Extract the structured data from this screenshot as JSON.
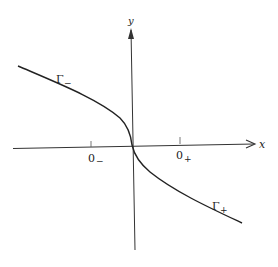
{
  "diagram": {
    "axes": {
      "x_label": "x",
      "y_label": "y"
    },
    "ticks": [
      {
        "label": "0",
        "sub": "−",
        "name": "o-minus"
      },
      {
        "label": "0",
        "sub": "+",
        "name": "o-plus"
      }
    ],
    "curves": [
      {
        "label": "Γ",
        "sub": "−",
        "name": "gamma-minus"
      },
      {
        "label": "Γ",
        "sub": "+",
        "name": "gamma-plus"
      }
    ],
    "colors": {
      "stroke": "#222222",
      "background": "#ffffff"
    }
  }
}
